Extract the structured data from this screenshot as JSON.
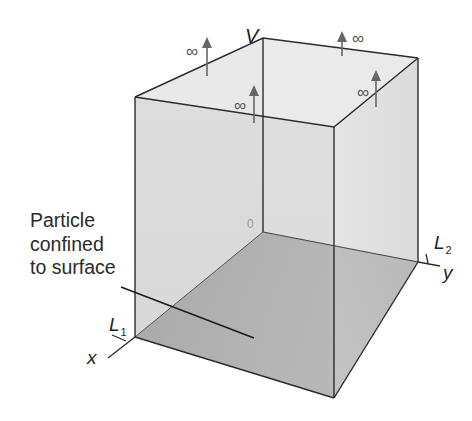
{
  "diagram": {
    "annotation": {
      "lines": [
        "Particle",
        "confined",
        "to surface"
      ]
    },
    "potential_label": "V",
    "infinity_symbol": "∞",
    "infinity_markers": 4,
    "origin_label": "0",
    "axes": {
      "x": {
        "label": "x",
        "length_label": "L",
        "length_sub": "1"
      },
      "y": {
        "label": "y",
        "length_label": "L",
        "length_sub": "2"
      }
    },
    "colors": {
      "walls": "#dcdcdc",
      "side_wall": "#e4e4e4",
      "top_face": "#ececec",
      "floor": "#7d7d7d",
      "edges": "#2b2b2b",
      "arrows": "#666666"
    }
  }
}
